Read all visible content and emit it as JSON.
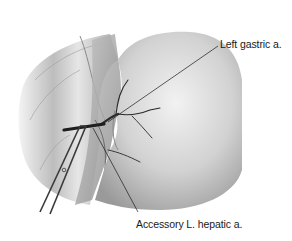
{
  "figure": {
    "type": "anatomical illustration",
    "palette": {
      "background": "#ffffff",
      "tissue_light": "#e4e4e4",
      "tissue_mid": "#b8b8b8",
      "tissue_dark": "#6e6e6e",
      "vessel": "#2a2a2a",
      "leader_line": "#1a1a1a"
    }
  },
  "labels": {
    "left_gastric": "Left gastric a.",
    "accessory_hepatic": "Accessory L. hepatic a."
  }
}
